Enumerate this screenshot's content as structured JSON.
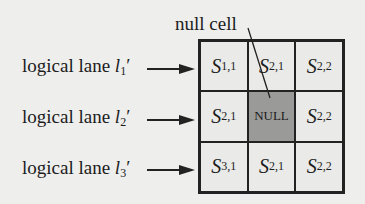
{
  "annotation": {
    "label": "null cell"
  },
  "lanes": [
    {
      "text": "logical lane ",
      "symbol": "l",
      "subscript": "1",
      "prime": "′"
    },
    {
      "text": "logical lane ",
      "symbol": "l",
      "subscript": "2",
      "prime": "′"
    },
    {
      "text": "logical lane ",
      "symbol": "l",
      "subscript": "3",
      "prime": "′"
    }
  ],
  "grid": [
    [
      {
        "sym": "S",
        "sub": "1,1"
      },
      {
        "sym": "S",
        "sub": "2,1"
      },
      {
        "sym": "S",
        "sub": "2,2"
      }
    ],
    [
      {
        "sym": "S",
        "sub": "2,1"
      },
      {
        "null": "NULL"
      },
      {
        "sym": "S",
        "sub": "2,2"
      }
    ],
    [
      {
        "sym": "S",
        "sub": "3,1"
      },
      {
        "sym": "S",
        "sub": "2,1"
      },
      {
        "sym": "S",
        "sub": "2,2"
      }
    ]
  ],
  "colors": {
    "null_cell": "#9a9a98",
    "cell": "#eaeae8",
    "line": "#222222"
  }
}
